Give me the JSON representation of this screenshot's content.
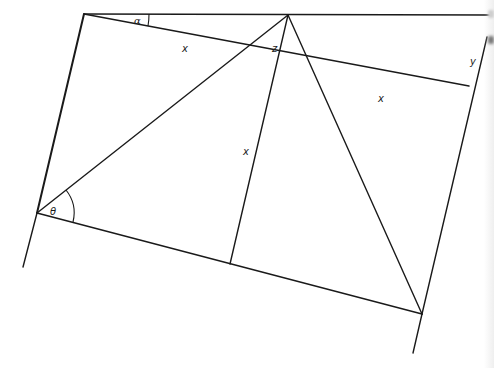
{
  "diagram": {
    "title": "",
    "stroke_color": "#1a1a1a",
    "background_color": "#ffffff",
    "points": {
      "top_left": [
        84,
        14
      ],
      "apex": [
        288,
        15
      ],
      "top_right_end": [
        488,
        15
      ],
      "left_vertex": [
        37,
        213
      ],
      "left_line_bottom": [
        23,
        267
      ],
      "mid_top_on_diagonal": [
        275,
        36
      ],
      "mid_bottom": [
        230,
        264
      ],
      "right_line_top": [
        487,
        37
      ],
      "right_diag_end": [
        469,
        86
      ],
      "bottom_right": [
        422,
        314
      ],
      "bottom_right_line_end": [
        413,
        353
      ]
    },
    "labels": {
      "alpha": "α",
      "theta": "θ",
      "x_top_diagonal": "x",
      "x_right_diagonal": "x",
      "x_vertical": "x",
      "z": "z",
      "y": "y"
    }
  }
}
